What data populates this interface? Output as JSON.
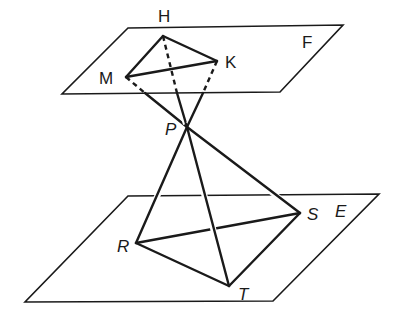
{
  "diagram": {
    "planes": [
      {
        "name": "F",
        "label": "F",
        "corners": [
          [
            128,
            28
          ],
          [
            343,
            25
          ],
          [
            280,
            92
          ],
          [
            62,
            94
          ]
        ]
      },
      {
        "name": "E",
        "label": "E",
        "corners": [
          [
            128,
            196
          ],
          [
            379,
            194
          ],
          [
            273,
            301
          ],
          [
            25,
            302
          ]
        ]
      }
    ],
    "points": {
      "H": {
        "label": "H",
        "x": 163,
        "y": 36,
        "label_x": 164,
        "label_y": 22
      },
      "K": {
        "label": "K",
        "x": 217,
        "y": 61,
        "label_x": 232,
        "label_y": 68
      },
      "M": {
        "label": "M",
        "x": 126,
        "y": 77,
        "label_x": 108,
        "label_y": 84
      },
      "P": {
        "label": "P",
        "x": 187,
        "y": 127,
        "label_x": 171,
        "label_y": 135
      },
      "R": {
        "label": "R",
        "x": 136,
        "y": 243,
        "label_x": 122,
        "label_y": 252
      },
      "S": {
        "label": "S",
        "x": 300,
        "y": 213,
        "label_x": 313,
        "label_y": 221
      },
      "T": {
        "label": "T",
        "x": 229,
        "y": 286,
        "label_x": 243,
        "label_y": 300
      }
    },
    "labels": {
      "H": "H",
      "K": "K",
      "M": "M",
      "P": "P",
      "R": "R",
      "S": "S",
      "T": "T",
      "F": "F",
      "E": "E"
    },
    "segments": {
      "solid": [
        "HK",
        "KM",
        "MH",
        "PR",
        "PS",
        "PT",
        "RS",
        "RT",
        "ST"
      ],
      "dashed_within_F": [
        "MP",
        "HP",
        "KP"
      ],
      "solid_below_F": [
        "MP",
        "HP",
        "KP"
      ]
    }
  }
}
